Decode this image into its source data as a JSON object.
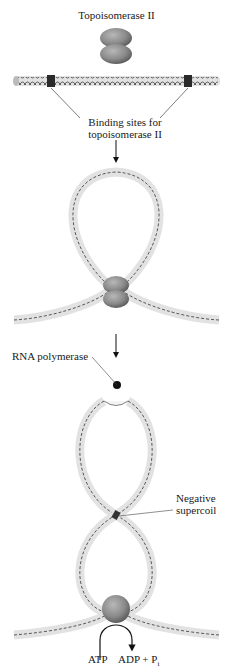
{
  "title": "Topoisomerase II",
  "labels": {
    "binding_sites_line1": "Binding sites for",
    "binding_sites_line2": "topoisomerase II",
    "rna_polymerase": "RNA polymerase",
    "negative_supercoil_line1": "Negative",
    "negative_supercoil_line2": "supercoil",
    "atp": "ATP",
    "adp_pi": "ADP + P",
    "pi_subscript": "i"
  },
  "colors": {
    "enzyme": "#8a8a8a",
    "dna_tube": "#dcdcdc",
    "dna_strand": "#333333",
    "binding_site": "#2a2a2a",
    "rna_polymerase": "#111111"
  },
  "stages": [
    {
      "name": "linear-dna-with-binding-sites"
    },
    {
      "name": "dna-loop-bound-by-topoisomerase"
    },
    {
      "name": "negative-supercoil-with-rna-polymerase"
    }
  ]
}
